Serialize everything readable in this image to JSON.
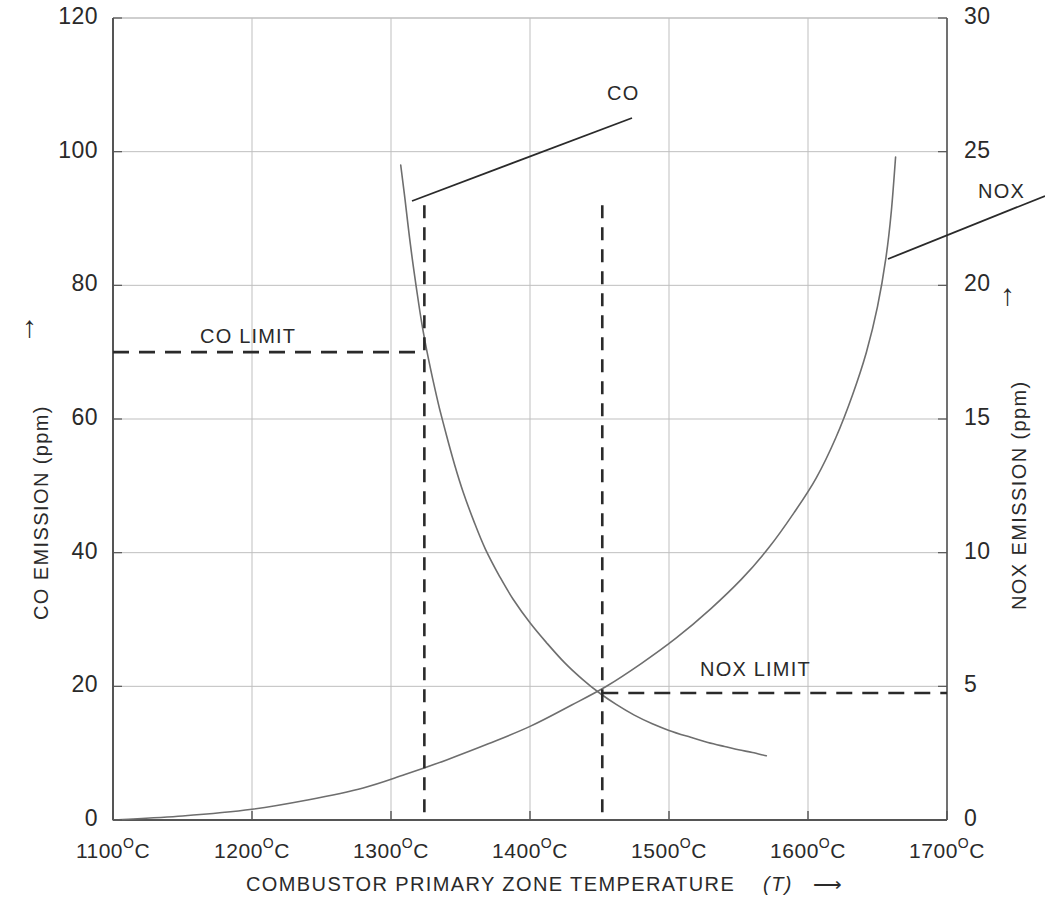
{
  "figure": {
    "background": "#ffffff",
    "ink": "#2a2a2a",
    "grid_color": "#bfbfbf",
    "axis_color": "#555555"
  },
  "axes": {
    "x_title_main": "COMBUSTOR PRIMARY ZONE TEMPERATURE",
    "x_title_symbol": "(T)",
    "x_title_arrow": "⟶",
    "left_title": "CO EMISSION (ppm)",
    "left_arrow": "↑",
    "right_title": "NOX EMISSION (ppm)",
    "right_arrow": "↑",
    "x_unit_suffix": "C",
    "x_degree": "O"
  },
  "annotations": {
    "co_series_label": "CO",
    "nox_series_label": "NOX",
    "co_limit_label": "CO LIMIT",
    "nox_limit_label": "NOX LIMIT"
  },
  "chart_data": {
    "type": "line",
    "title": "",
    "xlabel": "COMBUSTOR PRIMARY ZONE TEMPERATURE (T)",
    "ylabel": "CO EMISSION (ppm)",
    "y2label": "NOX EMISSION (ppm)",
    "xlim": [
      1100,
      1700
    ],
    "ylim": [
      0,
      120
    ],
    "y2lim": [
      0,
      30
    ],
    "xticks": [
      1100,
      1200,
      1300,
      1400,
      1500,
      1600,
      1700
    ],
    "xticklabels": [
      "1100 °C",
      "1200 °C",
      "1300 °C",
      "1400 °C",
      "1500 °C",
      "1600 °C",
      "1700 °C"
    ],
    "yticks": [
      0,
      20,
      40,
      60,
      80,
      100,
      120
    ],
    "yticklabels": [
      "0",
      "20",
      "40",
      "60",
      "80",
      "100",
      "120"
    ],
    "y2ticks": [
      0,
      5,
      10,
      15,
      20,
      25,
      30
    ],
    "y2ticklabels": [
      "0",
      "5",
      "10",
      "15",
      "20",
      "25",
      "30"
    ],
    "grid": true,
    "legend": "none",
    "series": [
      {
        "name": "CO",
        "axis": "left",
        "units": "ppm",
        "x": [
          1307,
          1310,
          1314,
          1318,
          1322,
          1326,
          1330,
          1335,
          1340,
          1346,
          1352,
          1360,
          1368,
          1378,
          1388,
          1400,
          1412,
          1425,
          1438,
          1450,
          1462,
          1475,
          1488,
          1500,
          1515,
          1528,
          1540,
          1550,
          1560,
          1570
        ],
        "y": [
          98.0,
          93.0,
          86.0,
          80.0,
          74.5,
          70.0,
          66.0,
          61.5,
          57.5,
          53.0,
          49.0,
          44.5,
          40.5,
          36.5,
          33.0,
          29.5,
          26.5,
          23.5,
          21.0,
          19.0,
          17.3,
          15.7,
          14.4,
          13.4,
          12.4,
          11.6,
          11.0,
          10.5,
          10.1,
          9.6
        ]
      },
      {
        "name": "NOX",
        "axis": "right",
        "units": "ppm",
        "x": [
          1100,
          1150,
          1200,
          1240,
          1280,
          1310,
          1340,
          1370,
          1400,
          1430,
          1455,
          1480,
          1505,
          1530,
          1552,
          1572,
          1590,
          1606,
          1620,
          1632,
          1642,
          1650,
          1656,
          1660,
          1663
        ],
        "y": [
          0.0,
          0.15,
          0.4,
          0.75,
          1.2,
          1.7,
          2.25,
          2.85,
          3.5,
          4.3,
          5.0,
          5.85,
          6.8,
          7.9,
          9.0,
          10.2,
          11.5,
          12.8,
          14.3,
          15.9,
          17.5,
          19.2,
          21.0,
          22.8,
          24.8
        ]
      }
    ],
    "limits": [
      {
        "name": "CO LIMIT",
        "axis": "left",
        "value": 70,
        "style": "dashed-horizontal",
        "x_from": 1100,
        "x_to": 1324
      },
      {
        "name": "NOX LIMIT",
        "axis": "right",
        "value": 4.75,
        "style": "dashed-horizontal",
        "x_from": 1452,
        "x_to": 1700
      }
    ],
    "verticals": [
      {
        "x": 1324,
        "style": "dashed",
        "y_top_ppm": 92,
        "y_bottom_ppm": 0
      },
      {
        "x": 1452,
        "style": "dashed",
        "y_top_ppm": 92,
        "y_bottom_ppm": 0
      }
    ]
  }
}
